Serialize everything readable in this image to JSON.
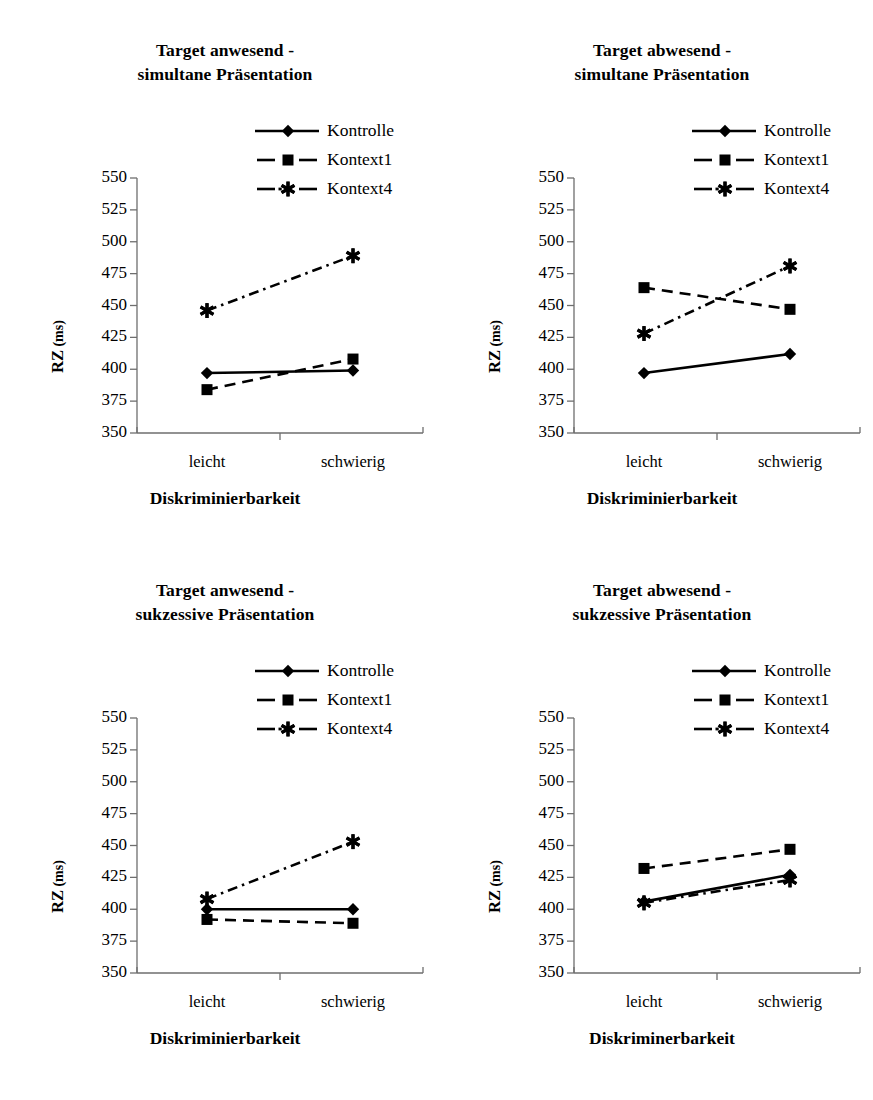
{
  "figure": {
    "panel_count": 4,
    "series_names": [
      "Kontrolle",
      "Kontext1",
      "Kontext4"
    ],
    "categories": [
      "leicht",
      "schwierig"
    ],
    "y_ticks": [
      "350",
      "375",
      "400",
      "425",
      "450",
      "475",
      "500",
      "525",
      "550"
    ],
    "y_axis_title_main": "RZ",
    "y_axis_title_unit": " (ms)",
    "colors": {
      "ink": "#000000",
      "axis": "#808080",
      "background": "#ffffff"
    }
  },
  "chart_data": [
    {
      "type": "line",
      "title": "Target anwesend - simultane Präsentation",
      "title_line1": "Target anwesend -",
      "title_line2": "simultane Präsentation",
      "xlabel": "Diskriminierbarkeit",
      "ylabel": "RZ (ms)",
      "categories": [
        "leicht",
        "schwierig"
      ],
      "ylim": [
        350,
        550
      ],
      "ytick_step": 25,
      "grid": false,
      "legend_position": "top-right",
      "series": [
        {
          "name": "Kontrolle",
          "values": [
            397,
            399
          ],
          "marker": "diamond",
          "line": "solid"
        },
        {
          "name": "Kontext1",
          "values": [
            384,
            408
          ],
          "marker": "square",
          "line": "dashed"
        },
        {
          "name": "Kontext4",
          "values": [
            446,
            489
          ],
          "marker": "asterisk",
          "line": "dash-dot"
        }
      ]
    },
    {
      "type": "line",
      "title": "Target abwesend - simultane Präsentation",
      "title_line1": "Target abwesend -",
      "title_line2": "simultane Präsentation",
      "xlabel": "Diskriminierbarkeit",
      "ylabel": "RZ (ms)",
      "categories": [
        "leicht",
        "schwierig"
      ],
      "ylim": [
        350,
        550
      ],
      "ytick_step": 25,
      "grid": false,
      "legend_position": "top-right",
      "series": [
        {
          "name": "Kontrolle",
          "values": [
            397,
            412
          ],
          "marker": "diamond",
          "line": "solid"
        },
        {
          "name": "Kontext1",
          "values": [
            464,
            447
          ],
          "marker": "square",
          "line": "dashed"
        },
        {
          "name": "Kontext4",
          "values": [
            428,
            481
          ],
          "marker": "asterisk",
          "line": "dash-dot"
        }
      ]
    },
    {
      "type": "line",
      "title": "Target anwesend - sukzessive Präsentation",
      "title_line1": "Target anwesend -",
      "title_line2": "sukzessive Präsentation",
      "xlabel": "Diskriminierbarkeit",
      "ylabel": "RZ (ms)",
      "categories": [
        "leicht",
        "schwierig"
      ],
      "ylim": [
        350,
        550
      ],
      "ytick_step": 25,
      "grid": false,
      "legend_position": "top-right",
      "series": [
        {
          "name": "Kontrolle",
          "values": [
            400,
            400
          ],
          "marker": "diamond",
          "line": "solid"
        },
        {
          "name": "Kontext1",
          "values": [
            392,
            389
          ],
          "marker": "square",
          "line": "dashed"
        },
        {
          "name": "Kontext4",
          "values": [
            408,
            453
          ],
          "marker": "asterisk",
          "line": "dash-dot"
        }
      ]
    },
    {
      "type": "line",
      "title": "Target abwesend - sukzessive Präsentation",
      "title_line1": "Target abwesend -",
      "title_line2": "sukzessive Präsentation",
      "xlabel": "Diskriminerbarkeit",
      "ylabel": "RZ (ms)",
      "categories": [
        "leicht",
        "schwierig"
      ],
      "ylim": [
        350,
        550
      ],
      "ytick_step": 25,
      "grid": false,
      "legend_position": "top-right",
      "series": [
        {
          "name": "Kontrolle",
          "values": [
            406,
            427
          ],
          "marker": "diamond",
          "line": "solid"
        },
        {
          "name": "Kontext1",
          "values": [
            432,
            447
          ],
          "marker": "square",
          "line": "dashed"
        },
        {
          "name": "Kontext4",
          "values": [
            405,
            423
          ],
          "marker": "asterisk",
          "line": "dash-dot"
        }
      ]
    }
  ]
}
